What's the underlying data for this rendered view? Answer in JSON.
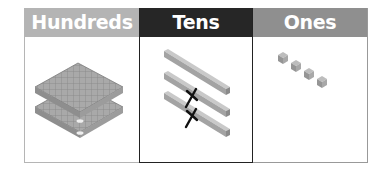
{
  "table": {
    "columns": [
      {
        "label": "Hundreds",
        "header_color": "#b4b4b4",
        "blocks": 2,
        "block_type": "flat-100"
      },
      {
        "label": "Tens",
        "header_color": "#262626",
        "blocks": 3,
        "block_type": "rod-10",
        "crossed_out": 2
      },
      {
        "label": "Ones",
        "header_color": "#8f8f8f",
        "blocks": 4,
        "block_type": "unit-1"
      }
    ]
  },
  "icons": {
    "cross_mark": "X"
  }
}
